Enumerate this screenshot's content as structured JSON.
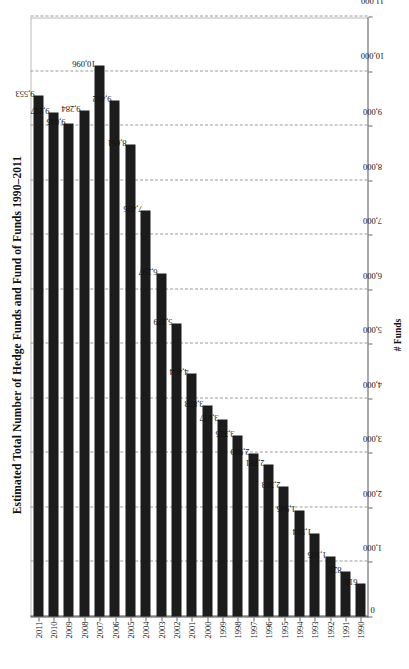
{
  "chart_data": {
    "type": "bar",
    "orientation": "horizontal",
    "title": "Estimated Total Number of Hedge Funds and Fund of Funds 1990–2011",
    "xlabel": "# Funds",
    "ylabel": "",
    "categories": [
      "2011",
      "2010",
      "2009",
      "2008",
      "2007",
      "2006",
      "2005",
      "2004",
      "2003",
      "2002",
      "2001",
      "2000",
      "1999",
      "1998",
      "1997",
      "1996",
      "1995",
      "1994",
      "1993",
      "1992",
      "1991",
      "1990"
    ],
    "values": [
      9553,
      9237,
      9045,
      9284,
      10096,
      9462,
      8661,
      7436,
      6297,
      5379,
      4454,
      3873,
      3617,
      3325,
      2990,
      2781,
      2383,
      1945,
      1514,
      1105,
      821,
      610
    ],
    "value_labels": [
      "9,553",
      "9,237",
      "9,045",
      "9,284",
      "10,096",
      "9,462",
      "8,661",
      "7,436",
      "6,297",
      "5,379",
      "4,454",
      "3,873",
      "3,617",
      "3,325",
      "2,990",
      "2,781",
      "2,383",
      "1,945",
      "1,514",
      "1,105",
      "821",
      "610"
    ],
    "xlim": [
      0,
      11000
    ],
    "xticks": [
      0,
      1000,
      2000,
      3000,
      4000,
      5000,
      6000,
      7000,
      8000,
      9000,
      10000,
      11000
    ],
    "xtick_labels": [
      "0",
      "1,000",
      "2,000",
      "3,000",
      "4,000",
      "5,000",
      "6,000",
      "7,000",
      "8,000",
      "9,000",
      "10,000",
      "11,000"
    ],
    "grid": "vertical-dashed",
    "legend": "none",
    "bar_color": "#1c1c1c",
    "grid_color": "#9b9b9b",
    "axis_color": "#555555",
    "series": [
      {
        "name": "# Funds",
        "values": [
          9553,
          9237,
          9045,
          9284,
          10096,
          9462,
          8661,
          7436,
          6297,
          5379,
          4454,
          3873,
          3617,
          3325,
          2990,
          2781,
          2383,
          1945,
          1514,
          1105,
          821,
          610
        ]
      }
    ]
  }
}
